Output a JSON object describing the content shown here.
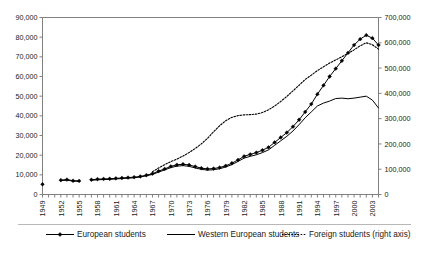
{
  "chart_data": {
    "type": "line",
    "title": "",
    "subtitle": "",
    "xlabel": "",
    "ylabel": "",
    "y2label": "",
    "grid": false,
    "legend_position": "bottom",
    "xlim": [
      1949,
      2004
    ],
    "ylim": [
      0,
      90000
    ],
    "y2lim": [
      0,
      700000
    ],
    "yticks": [
      0,
      10000,
      20000,
      30000,
      40000,
      50000,
      60000,
      70000,
      80000,
      90000
    ],
    "ytick_labels": [
      "0",
      "10,000",
      "20,000",
      "30,000",
      "40,000",
      "50,000",
      "60,000",
      "70,000",
      "80,000",
      "90,000"
    ],
    "y2ticks": [
      0,
      100000,
      200000,
      300000,
      400000,
      500000,
      600000,
      700000
    ],
    "y2tick_labels": [
      "0",
      "100,000",
      "200,000",
      "300,000",
      "400,000",
      "500,000",
      "600,000",
      "700,000"
    ],
    "xticks_all": [
      1949,
      1950,
      1951,
      1952,
      1953,
      1954,
      1955,
      1956,
      1957,
      1958,
      1959,
      1960,
      1961,
      1962,
      1963,
      1964,
      1965,
      1966,
      1967,
      1968,
      1969,
      1970,
      1971,
      1972,
      1973,
      1974,
      1975,
      1976,
      1977,
      1978,
      1979,
      1980,
      1981,
      1982,
      1983,
      1984,
      1985,
      1986,
      1987,
      1988,
      1989,
      1990,
      1991,
      1992,
      1993,
      1994,
      1995,
      1996,
      1997,
      1998,
      1999,
      2000,
      2001,
      2002,
      2003,
      2004
    ],
    "xtick_labels": [
      "1949",
      "1952",
      "1955",
      "1958",
      "1961",
      "1964",
      "1967",
      "1970",
      "1973",
      "1976",
      "1979",
      "1982",
      "1985",
      "1988",
      "1991",
      "1994",
      "1997",
      "2000",
      "2003"
    ],
    "xtick_label_years": [
      1949,
      1952,
      1955,
      1958,
      1961,
      1964,
      1967,
      1970,
      1973,
      1976,
      1979,
      1982,
      1985,
      1988,
      1991,
      1994,
      1997,
      2000,
      2003
    ],
    "x": [
      1949,
      1950,
      1951,
      1952,
      1953,
      1954,
      1955,
      1956,
      1957,
      1958,
      1959,
      1960,
      1961,
      1962,
      1963,
      1964,
      1965,
      1966,
      1967,
      1968,
      1969,
      1970,
      1971,
      1972,
      1973,
      1974,
      1975,
      1976,
      1977,
      1978,
      1979,
      1980,
      1981,
      1982,
      1983,
      1984,
      1985,
      1986,
      1987,
      1988,
      1989,
      1990,
      1991,
      1992,
      1993,
      1994,
      1995,
      1996,
      1997,
      1998,
      1999,
      2000,
      2001,
      2002,
      2003,
      2004
    ],
    "series": [
      {
        "name": "European students",
        "axis": "left",
        "style": "line-with-markers",
        "marker": "diamond",
        "color": "#000000",
        "values": [
          5200,
          null,
          null,
          7300,
          7600,
          7000,
          6900,
          null,
          7500,
          7800,
          7900,
          8000,
          8200,
          8400,
          8600,
          8800,
          9200,
          9800,
          10600,
          11900,
          13000,
          14300,
          15100,
          15400,
          15000,
          14200,
          13400,
          13000,
          13200,
          13700,
          14600,
          15900,
          17600,
          19400,
          20400,
          21300,
          22500,
          24000,
          26500,
          29000,
          31500,
          34500,
          38000,
          42000,
          46000,
          51000,
          55500,
          60000,
          64000,
          68000,
          72000,
          76000,
          79000,
          81000,
          79500,
          76000
        ]
      },
      {
        "name": "Western European students",
        "axis": "left",
        "style": "line",
        "marker": "none",
        "color": "#000000",
        "values": [
          5000,
          null,
          null,
          7000,
          7300,
          6800,
          6700,
          null,
          7200,
          7500,
          7600,
          7700,
          7900,
          8100,
          8300,
          8500,
          8900,
          9500,
          10200,
          11400,
          12500,
          13700,
          14400,
          14700,
          14300,
          13500,
          12800,
          12400,
          12600,
          13100,
          14000,
          15200,
          16800,
          18500,
          19400,
          20200,
          21300,
          22700,
          25000,
          27300,
          29600,
          32300,
          35500,
          39000,
          42000,
          45000,
          46500,
          47500,
          48800,
          49000,
          48700,
          49000,
          49500,
          50000,
          48000,
          44000
        ]
      },
      {
        "name": "Foreign students (right axis)",
        "axis": "right",
        "style": "dotted",
        "marker": "none",
        "color": "#000000",
        "values": [
          null,
          null,
          null,
          null,
          null,
          null,
          null,
          null,
          null,
          null,
          null,
          null,
          null,
          null,
          null,
          null,
          null,
          null,
          90000,
          105000,
          118000,
          130000,
          140000,
          152000,
          166000,
          182000,
          200000,
          222000,
          248000,
          272000,
          292000,
          305000,
          312000,
          315000,
          316000,
          318000,
          324000,
          335000,
          350000,
          368000,
          388000,
          410000,
          432000,
          455000,
          472000,
          490000,
          505000,
          520000,
          532000,
          545000,
          558000,
          572000,
          588000,
          600000,
          592000,
          575000
        ]
      }
    ]
  },
  "legend": {
    "items": [
      {
        "label": "European students",
        "marker": "diamond",
        "style": "line-with-markers"
      },
      {
        "label": "Western European students",
        "marker": "none",
        "style": "line"
      },
      {
        "label": "Foreign students (right axis)",
        "marker": "none",
        "style": "dotted"
      }
    ]
  },
  "colors": {
    "axis": "#808080",
    "line": "#000000",
    "text": "#1a1a1a",
    "background": "#ffffff"
  }
}
